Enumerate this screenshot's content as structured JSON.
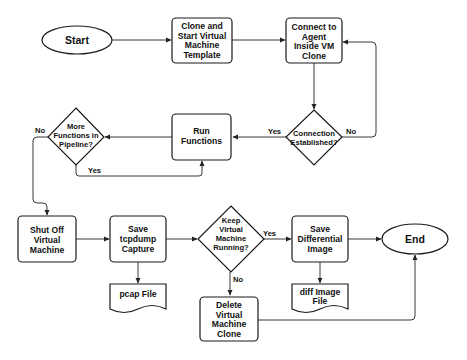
{
  "diagram": {
    "type": "flowchart",
    "nodes": {
      "start": {
        "label": [
          "Start"
        ],
        "shape": "terminator"
      },
      "clone": {
        "label": [
          "Clone and",
          "Start Virtual",
          "Machine",
          "Template"
        ],
        "shape": "process"
      },
      "connect": {
        "label": [
          "Connect to",
          "Agent",
          "Inside VM",
          "Clone"
        ],
        "shape": "process"
      },
      "connected": {
        "label": [
          "Connection",
          "Established?"
        ],
        "shape": "decision"
      },
      "run": {
        "label": [
          "Run",
          "Functions"
        ],
        "shape": "process"
      },
      "more": {
        "label": [
          "More",
          "Functions in",
          "Pipeline?"
        ],
        "shape": "decision"
      },
      "shutoff": {
        "label": [
          "Shut Off",
          "Virtual",
          "Machine"
        ],
        "shape": "process"
      },
      "tcpdump": {
        "label": [
          "Save",
          "tcpdump",
          "Capture"
        ],
        "shape": "process"
      },
      "pcap": {
        "label": [
          "pcap File"
        ],
        "shape": "document"
      },
      "keep": {
        "label": [
          "Keep",
          "Virtual",
          "Machine",
          "Running?"
        ],
        "shape": "decision"
      },
      "delete": {
        "label": [
          "Delete",
          "Virtual",
          "Machine",
          "Clone"
        ],
        "shape": "process"
      },
      "diffsave": {
        "label": [
          "Save",
          "Differential",
          "Image"
        ],
        "shape": "process"
      },
      "difffile": {
        "label": [
          "diff Image",
          "File"
        ],
        "shape": "document"
      },
      "end": {
        "label": [
          "End"
        ],
        "shape": "terminator"
      }
    },
    "edges": [
      {
        "from": "start",
        "to": "clone",
        "label": ""
      },
      {
        "from": "clone",
        "to": "connect",
        "label": ""
      },
      {
        "from": "connect",
        "to": "connected",
        "label": ""
      },
      {
        "from": "connected",
        "to": "connect",
        "label": "No"
      },
      {
        "from": "connected",
        "to": "run",
        "label": "Yes"
      },
      {
        "from": "run",
        "to": "more",
        "label": ""
      },
      {
        "from": "more",
        "to": "run",
        "label": "Yes"
      },
      {
        "from": "more",
        "to": "shutoff",
        "label": "No"
      },
      {
        "from": "shutoff",
        "to": "tcpdump",
        "label": ""
      },
      {
        "from": "tcpdump",
        "to": "pcap",
        "label": ""
      },
      {
        "from": "tcpdump",
        "to": "keep",
        "label": ""
      },
      {
        "from": "keep",
        "to": "diffsave",
        "label": "Yes"
      },
      {
        "from": "keep",
        "to": "delete",
        "label": "No"
      },
      {
        "from": "diffsave",
        "to": "difffile",
        "label": ""
      },
      {
        "from": "diffsave",
        "to": "end",
        "label": ""
      },
      {
        "from": "delete",
        "to": "end",
        "label": ""
      }
    ],
    "edge_labels": {
      "connected_no": "No",
      "connected_yes": "Yes",
      "more_yes": "Yes",
      "more_no": "No",
      "keep_yes": "Yes",
      "keep_no": "No"
    }
  }
}
